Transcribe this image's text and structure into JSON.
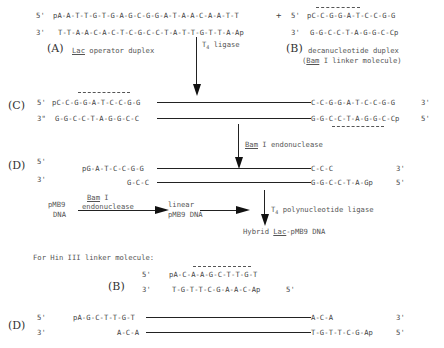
{
  "step_A": {
    "strand_top_5": "5'",
    "strand_top_seq": "pA-A-T-T-G-T-G-A-G-C-G-G-A-T-A-A-C-A-A-T-T",
    "strand_bottom_3": "3'",
    "strand_bottom_seq": "T-T-A-A-C-A-C-T-C-G-C-C-T-A-T-T-G-T-T-A-Ap",
    "label_letter": "(A)",
    "label_text_prefix": "",
    "label_text_underlined": "Lac",
    "label_text_suffix": " operator duplex",
    "plus": "+"
  },
  "step_B": {
    "strand_top_5": "5'",
    "strand_top_seq": "pC-C-G-G-A-T-C-C-G-G",
    "strand_bottom_3": "3'",
    "strand_bottom_seq": "G-G-C-C-T-A-G-G-C-Cp",
    "label_letter": "(B)",
    "label_text": "decanucleotide duplex",
    "label_sub_open": "(",
    "label_sub_underlined": "Bam",
    "label_sub_rest": " I linker molecule)"
  },
  "arrow_1": {
    "enzyme": "T",
    "enzyme_sub": "4",
    "enzyme_rest": " ligase"
  },
  "step_C": {
    "label_letter": "(C)",
    "top_5": "5'",
    "top_left_seq": "pC-C-G-G-A-T-C-C-G-G",
    "top_right_seq": "C-C-G-G-A-T-C-C-G-G",
    "top_3": "3'",
    "bottom_3": "3\"",
    "bottom_left_seq": "G-G-C-C-T-A-G-G-C-C",
    "bottom_right_seq": "G-G-C-C-T-A-G-G-C-Cp",
    "bottom_5": "5'"
  },
  "arrow_2": {
    "enzyme_underlined": "Bam",
    "enzyme_rest": " I endonuclease"
  },
  "step_D": {
    "label_letter": "(D)",
    "top_5": "5'",
    "top_left_seq": "pG-A-T-C-C-G-G",
    "top_right_seq": "C-C-C",
    "top_3": "3'",
    "bottom_3": "3'",
    "bottom_left_seq": "G-C-C",
    "bottom_right_seq": "G-G-C-C-T-A-Gp",
    "bottom_5": "5'"
  },
  "pathway": {
    "source_line1": "pMB9",
    "source_line2": "DNA",
    "enzyme_line1_underlined": "Bam",
    "enzyme_line1_rest": " I",
    "enzyme_line2": "endonuclease",
    "intermediate_line1": "linear",
    "intermediate_line2": "pMB9 DNA",
    "ligase_T": "T",
    "ligase_sub": "4",
    "ligase_rest": " polynucleotide ligase",
    "product_prefix": "Hybrid ",
    "product_underlined": "Lac",
    "product_rest": "-pMB9 DNA"
  },
  "hin_section": {
    "heading": "For Hin III linker molecule:",
    "label_letter": "(B)",
    "top_5": "5'",
    "top_seq": "pA-C-A-A-G-C-T-T-G-T",
    "bottom_3": "3'",
    "bottom_seq": "T-G-T-T-C-G-A-A-C-Ap",
    "bottom_5": "5'"
  },
  "step_D2": {
    "label_letter": "(D)",
    "top_5": "5'",
    "top_left_seq": "pA-G-C-T-T-G-T",
    "top_right_seq": "A-C-A",
    "top_3": "3'",
    "bottom_3": "3'",
    "bottom_left_seq": "A-C-A",
    "bottom_right_seq": "T-G-T-T-C-G-Ap",
    "bottom_5": "5'"
  }
}
